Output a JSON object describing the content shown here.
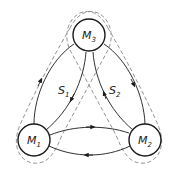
{
  "diagram": {
    "nodes": [
      {
        "id": "M1",
        "main": "M",
        "sub": "1"
      },
      {
        "id": "M2",
        "main": "M",
        "sub": "2"
      },
      {
        "id": "M3",
        "main": "M",
        "sub": "3"
      }
    ],
    "sets": [
      {
        "id": "S1",
        "main": "S",
        "sub": "1",
        "members": [
          "M1",
          "M3"
        ]
      },
      {
        "id": "S2",
        "main": "S",
        "sub": "2",
        "members": [
          "M3",
          "M2"
        ]
      }
    ],
    "edges": [
      {
        "from": "M1",
        "to": "M3"
      },
      {
        "from": "M3",
        "to": "M1"
      },
      {
        "from": "M3",
        "to": "M2"
      },
      {
        "from": "M2",
        "to": "M3"
      },
      {
        "from": "M1",
        "to": "M2"
      },
      {
        "from": "M2",
        "to": "M1"
      }
    ],
    "colors": {
      "stroke": "#1a1a1a",
      "dashed": "#777777",
      "background": "#ffffff"
    }
  }
}
